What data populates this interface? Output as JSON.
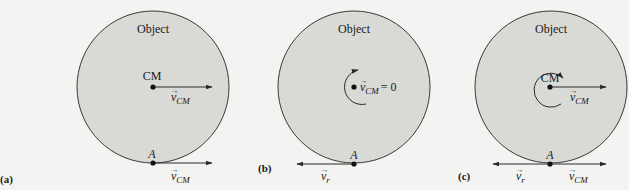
{
  "figure": {
    "colors": {
      "background": "#f3f3f1",
      "object_fill": "#d9d9d6",
      "outline": "#3a3a3a",
      "arrow": "#2a2a2a",
      "streak": "#8a8a8a"
    },
    "panels": [
      {
        "id": "a",
        "panel_label": "(a)",
        "object_label": "Object",
        "cm_label": "CM",
        "cm_velocity_label": "v",
        "cm_velocity_subscript": "CM",
        "point_label": "A",
        "point_velocity_label": "v",
        "point_velocity_subscript": "CM",
        "motion_streaks": true,
        "rotation_arrow": false
      },
      {
        "id": "b",
        "panel_label": "(b)",
        "object_label": "Object",
        "cm_velocity_label": "v",
        "cm_velocity_subscript": "CM",
        "cm_velocity_value": "= 0",
        "point_label": "A",
        "point_velocity_label": "v",
        "point_velocity_subscript": "r",
        "motion_streaks": false,
        "rotation_arrow": true
      },
      {
        "id": "c",
        "panel_label": "(c)",
        "object_label": "Object",
        "cm_label": "CM",
        "cm_velocity_label": "v",
        "cm_velocity_subscript": "CM",
        "point_label": "A",
        "point_velocity_left_label": "v",
        "point_velocity_left_subscript": "r",
        "point_velocity_right_label": "v",
        "point_velocity_right_subscript": "CM",
        "motion_streaks": true,
        "rotation_arrow": true
      }
    ]
  }
}
